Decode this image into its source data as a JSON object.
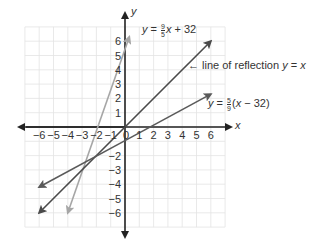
{
  "figure": {
    "type": "coordinate-plane-diagram",
    "axes": {
      "x_label": "x",
      "y_label": "y",
      "x_ticks": [
        "-6",
        "-5",
        "-4",
        "-3",
        "-2",
        "-1",
        "0",
        "1",
        "2",
        "3",
        "4",
        "5",
        "6"
      ],
      "y_ticks": [
        "6",
        "5",
        "4",
        "3",
        "2",
        "1",
        "-2",
        "-3",
        "-4",
        "-5",
        "-6"
      ],
      "origin_label": "0",
      "range": {
        "xmin": -7,
        "xmax": 7,
        "ymin": -7,
        "ymax": 7
      }
    },
    "lines": [
      {
        "name": "fahrenheit-line",
        "equation_prefix": "y = ",
        "frac_num": "9",
        "frac_den": "5",
        "equation_suffix": "x + 32",
        "color": "#a6a6a6",
        "from": [
          -4,
          -6
        ],
        "to": [
          0.3,
          6.3
        ]
      },
      {
        "name": "reflection-line",
        "label": "line of reflection",
        "equation": "y = x",
        "color": "#4a4a4a",
        "from": [
          -6,
          -6
        ],
        "to": [
          6,
          6
        ]
      },
      {
        "name": "celsius-line",
        "equation_prefix": "y = ",
        "frac_num": "5",
        "frac_den": "9",
        "equation_suffix": "(x − 32)",
        "color": "#5a5a5a",
        "from": [
          -6,
          -4.2
        ],
        "to": [
          6,
          2.3
        ]
      }
    ],
    "annotation_arrow": "←",
    "colors": {
      "grid": "#e3e3e3",
      "axis": "#222222",
      "text": "#333333"
    }
  }
}
